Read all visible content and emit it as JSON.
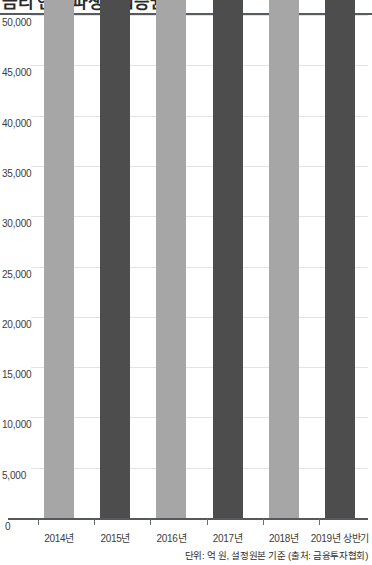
{
  "chart_data": {
    "type": "bar",
    "title": "",
    "xlabel": "",
    "ylabel": "",
    "categories": [
      "2014년",
      "2015년",
      "2016년",
      "2017년",
      "2018년",
      "2019년 상반기"
    ],
    "values": [
      74880,
      115122,
      198475,
      284953,
      378496,
      445602
    ],
    "value_labels": [
      "74,880",
      "115,122",
      "198,475",
      "284,953",
      "378,496",
      "445,602"
    ],
    "series": [
      {
        "name": "설정원본",
        "values": [
          74880,
          115122,
          198475,
          284953,
          378496,
          445602
        ]
      }
    ],
    "ylim": [
      0,
      50000
    ],
    "ytick_values": [
      0,
      5000,
      10000,
      15000,
      20000,
      25000,
      30000,
      35000,
      40000,
      45000,
      50000
    ],
    "ytick_labels": [
      "0",
      "5,000",
      "10,000",
      "15,000",
      "20,000",
      "25,000",
      "30,000",
      "35,000",
      "40,000",
      "45,000",
      "50,000"
    ],
    "grid": true,
    "legend": "none",
    "bar_colors": [
      "#a6a6a6",
      "#4d4d4d",
      "#a6a6a6",
      "#4d4d4d",
      "#a6a6a6",
      "#4d4d4d"
    ],
    "annotations": [
      "단위: 억 원, 설정원본 기준 (출처: 금융투자협회)"
    ]
  },
  "header": {
    "clipped_title": "금리 연계 파생결합증권"
  },
  "footer": {
    "note": "단위: 억 원, 설정원본 기준 (출처: 금융투자협회)"
  },
  "axis": {
    "zero_label": "0"
  },
  "colors": {
    "light_bar": "#a6a6a6",
    "dark_bar": "#4d4d4d",
    "gridline": "#e3e3e3",
    "axis": "#56595c",
    "text": "#3c3c3c"
  }
}
